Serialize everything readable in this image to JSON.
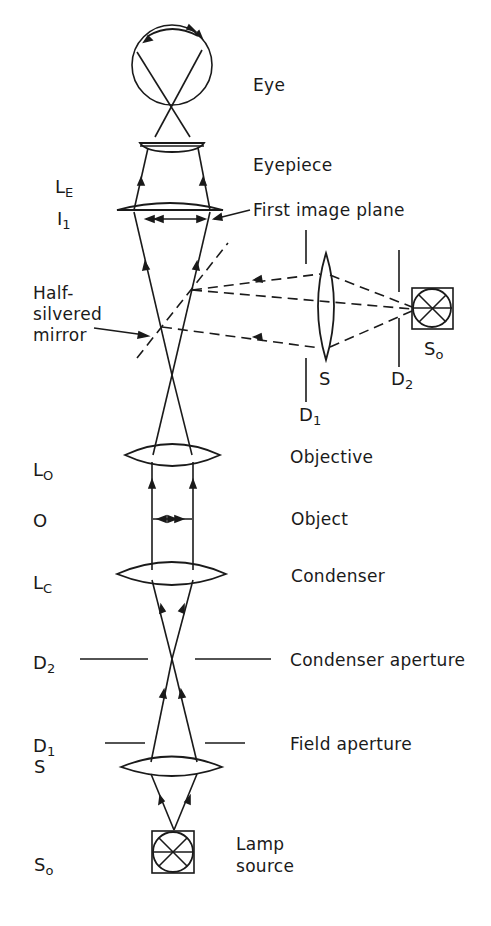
{
  "diagram": {
    "type": "optical ray diagram",
    "components": [
      {
        "symbol": "",
        "label": "Eye"
      },
      {
        "symbol": "",
        "label": "Eyepiece"
      },
      {
        "symbol": "L_E",
        "label": ""
      },
      {
        "symbol": "I_1",
        "label": "First image plane"
      },
      {
        "symbol": "",
        "label": "Half-silvered mirror"
      },
      {
        "symbol": "L_O",
        "label": "Objective"
      },
      {
        "symbol": "O",
        "label": "Object"
      },
      {
        "symbol": "L_C",
        "label": "Condenser"
      },
      {
        "symbol": "D_2",
        "label": "Condenser aperture"
      },
      {
        "symbol": "D_1",
        "label": "Field aperture"
      },
      {
        "symbol": "S",
        "label": ""
      },
      {
        "symbol": "S_o",
        "label": "Lamp source"
      }
    ],
    "side_branch": [
      {
        "symbol": "D_1"
      },
      {
        "symbol": "S"
      },
      {
        "symbol": "D_2"
      },
      {
        "symbol": "S_o"
      }
    ]
  },
  "labels": {
    "eye": "Eye",
    "eyepiece": "Eyepiece",
    "first_image_plane": "First image plane",
    "half_silvered_line1": "Half-",
    "half_silvered_line2": "silvered",
    "half_silvered_line3": "mirror",
    "objective": "Objective",
    "object": "Object",
    "condenser": "Condenser",
    "condenser_aperture": "Condenser aperture",
    "field_aperture": "Field aperture",
    "lamp_line1": "Lamp",
    "lamp_line2": "source"
  },
  "symbols": {
    "le_main": "L",
    "le_sub": "E",
    "i1_main": "I",
    "i1_sub": "1",
    "lo_main": "L",
    "lo_sub": "O",
    "o_main": "O",
    "lc_main": "L",
    "lc_sub": "C",
    "d2_main": "D",
    "d2_sub": "2",
    "d1_main": "D",
    "d1_sub": "1",
    "s_main": "S",
    "so_main": "S",
    "so_sub": "o",
    "side_s": "S",
    "side_d1_main": "D",
    "side_d1_sub": "1",
    "side_d2_main": "D",
    "side_d2_sub": "2",
    "side_so_main": "S",
    "side_so_sub": "o"
  },
  "colors": {
    "ink": "#1a1a1a",
    "background": "#ffffff"
  }
}
